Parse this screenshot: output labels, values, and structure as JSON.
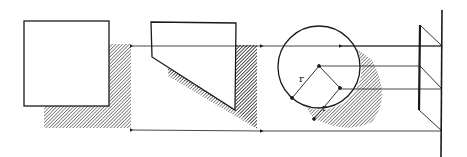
{
  "diagram": {
    "colors": {
      "ink": "#1a1a1a",
      "hatch": "#333333",
      "background": "#ffffff"
    },
    "shapes": [
      {
        "id": "square",
        "label": "Square with cast shadow"
      },
      {
        "id": "pentagon",
        "label": "Truncated shape with cast shadow"
      },
      {
        "id": "circle",
        "label": "Circle with cast shadow"
      },
      {
        "id": "elevation",
        "label": "Side elevation of wall and plane"
      }
    ],
    "circle_labels": {
      "radius_1": "r",
      "radius_2": "r"
    }
  }
}
